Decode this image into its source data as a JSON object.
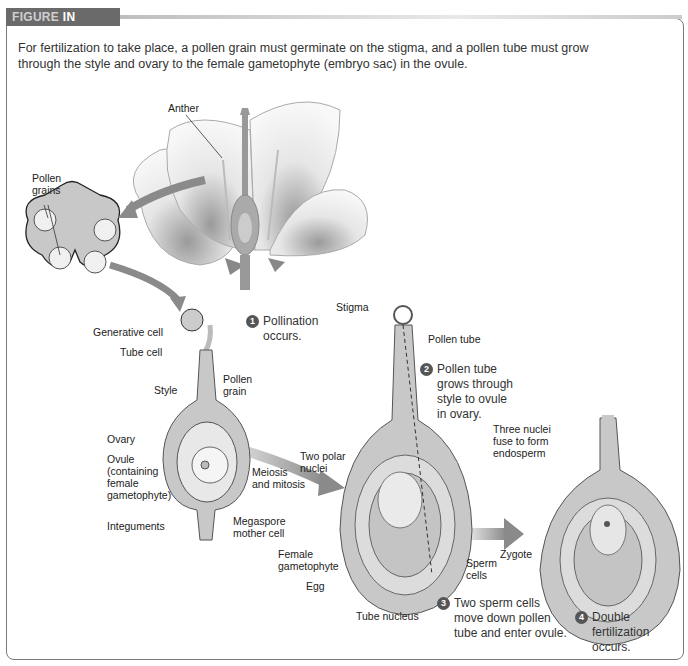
{
  "header": {
    "label_part1": "FIGURE",
    "label_part2": " IN FOCUS"
  },
  "intro": "For fertilization to take place, a pollen grain must germinate on the stigma, and a pollen tube must grow through the style and ovary to the female gametophyte (embryo sac) in the ovule.",
  "labels": {
    "anther": "Anther",
    "pollen_grains": "Pollen\ngrains",
    "generative_cell": "Generative cell",
    "tube_cell": "Tube cell",
    "style": "Style",
    "pollen_grain": "Pollen\ngrain",
    "ovary": "Ovary",
    "ovule": "Ovule\n(containing\nfemale\ngametophyte)",
    "integuments": "Integuments",
    "megaspore_mother_cell": "Megaspore\nmother cell",
    "meiosis_mitosis": "Meiosis\nand mitosis",
    "stigma": "Stigma",
    "pollen_tube": "Pollen tube",
    "two_polar_nuclei": "Two polar\nnuclei",
    "female_gametophyte": "Female\ngametophyte",
    "egg": "Egg",
    "tube_nucleus": "Tube nucleus",
    "sperm_cells": "Sperm\ncells",
    "three_nuclei": "Three nuclei\nfuse to form\nendosperm",
    "zygote": "Zygote"
  },
  "steps": [
    {
      "num": "1",
      "text": "Pollination\noccurs."
    },
    {
      "num": "2",
      "text": "Pollen tube\ngrows through\nstyle to ovule\nin ovary."
    },
    {
      "num": "3",
      "text": "Two sperm cells\nmove down pollen\ntube and enter ovule."
    },
    {
      "num": "4",
      "text": "Double\nfertilization\noccurs."
    }
  ],
  "colors": {
    "header_bg": "#6a6a6a",
    "tissue": "#c8c8c8",
    "tissue_dark": "#a8a8a8",
    "arrow": "#8a8a8a",
    "number_badge": "#555555"
  }
}
